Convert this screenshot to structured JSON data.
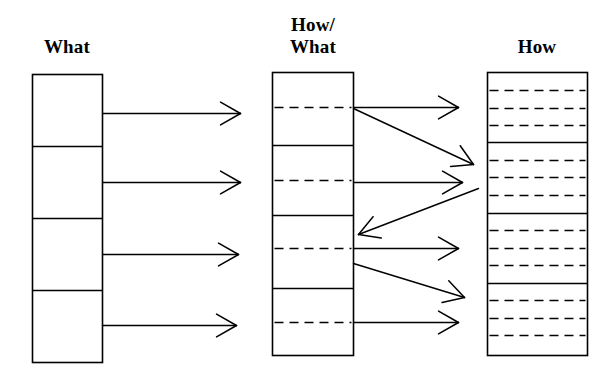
{
  "diagram": {
    "kind": "three-column-mapping-diagram",
    "background_color": "#ffffff",
    "stroke_color": "#000000",
    "columns": [
      {
        "id": "what",
        "title": "What",
        "box": {
          "x": 32,
          "y": 74,
          "width": 70,
          "height": 288
        },
        "solid_dividers_y": [
          146,
          218,
          290
        ],
        "dashed_dividers_y": [],
        "segment_count": 4
      },
      {
        "id": "how-what",
        "title": "How/\nWhat",
        "box": {
          "x": 272,
          "y": 72,
          "width": 81,
          "height": 283
        },
        "solid_dividers_y": [
          145,
          215,
          288
        ],
        "dashed_dividers_y": [
          107,
          180,
          248,
          322
        ],
        "segment_count": 8
      },
      {
        "id": "how",
        "title": "How",
        "box": {
          "x": 487,
          "y": 72,
          "width": 100,
          "height": 283
        },
        "solid_dividers_y": [
          142,
          213,
          283
        ],
        "dashed_dividers_y": [
          90,
          108,
          125,
          160,
          177,
          195,
          230,
          248,
          265,
          300,
          318,
          335
        ],
        "segment_count": 16
      }
    ],
    "arrows": [
      {
        "id": "what-to-howwhat-1",
        "from": [
          102,
          113
        ],
        "to": [
          240,
          113
        ],
        "style": "straight"
      },
      {
        "id": "what-to-howwhat-2",
        "from": [
          102,
          182
        ],
        "to": [
          240,
          182
        ],
        "style": "straight"
      },
      {
        "id": "what-to-howwhat-3",
        "from": [
          102,
          254
        ],
        "to": [
          238,
          254
        ],
        "style": "straight"
      },
      {
        "id": "what-to-howwhat-4",
        "from": [
          102,
          325
        ],
        "to": [
          236,
          325
        ],
        "style": "straight"
      },
      {
        "id": "howwhat-to-how-1",
        "from": [
          353,
          107
        ],
        "to": [
          458,
          107
        ],
        "style": "straight"
      },
      {
        "id": "howwhat-to-how-2",
        "from": [
          353,
          108
        ],
        "to": [
          473,
          164
        ],
        "style": "diagonal-down"
      },
      {
        "id": "howwhat-to-how-3",
        "from": [
          353,
          182
        ],
        "to": [
          462,
          182
        ],
        "style": "straight"
      },
      {
        "id": "how-to-howwhat-4",
        "from": [
          478,
          188
        ],
        "to": [
          358,
          234
        ],
        "style": "diagonal-up-left"
      },
      {
        "id": "howwhat-to-how-5",
        "from": [
          353,
          248
        ],
        "to": [
          458,
          248
        ],
        "style": "straight"
      },
      {
        "id": "howwhat-to-how-6",
        "from": [
          353,
          263
        ],
        "to": [
          464,
          297
        ],
        "style": "diagonal-down"
      },
      {
        "id": "howwhat-to-how-7",
        "from": [
          353,
          322
        ],
        "to": [
          458,
          322
        ],
        "style": "straight"
      }
    ]
  }
}
